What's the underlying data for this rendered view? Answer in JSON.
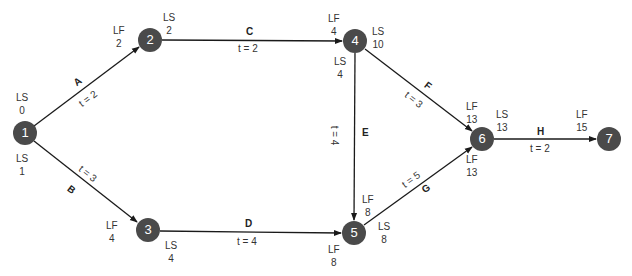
{
  "diagram": {
    "type": "activity-on-arrow network",
    "colors": {
      "node_fill": "#4a4a4a",
      "node_text": "#ffffff",
      "line": "#1a1a1a",
      "label": "#333333"
    },
    "nodes": [
      {
        "id": "1",
        "x": 25,
        "y": 133
      },
      {
        "id": "2",
        "x": 150,
        "y": 40
      },
      {
        "id": "3",
        "x": 148,
        "y": 230
      },
      {
        "id": "4",
        "x": 355,
        "y": 41
      },
      {
        "id": "5",
        "x": 354,
        "y": 233
      },
      {
        "id": "6",
        "x": 482,
        "y": 139
      },
      {
        "id": "7",
        "x": 609,
        "y": 139
      }
    ],
    "activities": [
      {
        "name": "A",
        "from": "1",
        "to": "2",
        "duration": "t = 2"
      },
      {
        "name": "B",
        "from": "1",
        "to": "3",
        "duration": "t = 3"
      },
      {
        "name": "C",
        "from": "2",
        "to": "4",
        "duration": "t = 2"
      },
      {
        "name": "D",
        "from": "3",
        "to": "5",
        "duration": "t = 4"
      },
      {
        "name": "E",
        "from": "4",
        "to": "5",
        "duration": "t = 4"
      },
      {
        "name": "F",
        "from": "4",
        "to": "6",
        "duration": "t = 3"
      },
      {
        "name": "G",
        "from": "5",
        "to": "6",
        "duration": "t = 5"
      },
      {
        "name": "H",
        "from": "6",
        "to": "7",
        "duration": "t = 2"
      }
    ],
    "labels": {
      "n1_ls_top": {
        "k": "LS",
        "v": "0"
      },
      "n1_ls_bottom": {
        "k": "LS",
        "v": "1"
      },
      "n2_lf": {
        "k": "LF",
        "v": "2"
      },
      "n2_ls": {
        "k": "LS",
        "v": "2"
      },
      "n3_lf": {
        "k": "LF",
        "v": "4"
      },
      "n3_ls": {
        "k": "LS",
        "v": "4"
      },
      "n4_lf": {
        "k": "LF",
        "v": "4"
      },
      "n4_ls_right": {
        "k": "LS",
        "v": "10"
      },
      "n4_ls_below": {
        "k": "LS",
        "v": "4"
      },
      "n5_lf_top": {
        "k": "LF",
        "v": "8"
      },
      "n5_ls": {
        "k": "LS",
        "v": "8"
      },
      "n5_lf_bottom": {
        "k": "LF",
        "v": "8"
      },
      "n6_lf_top": {
        "k": "LF",
        "v": "13"
      },
      "n6_ls": {
        "k": "LS",
        "v": "13"
      },
      "n6_lf_bottom": {
        "k": "LF",
        "v": "13"
      },
      "n7_lf": {
        "k": "LF",
        "v": "15"
      }
    }
  }
}
